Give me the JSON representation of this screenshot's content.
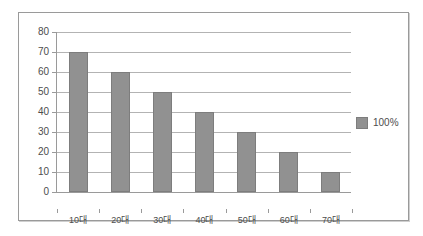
{
  "chart_data": {
    "type": "bar",
    "title": "",
    "subtitle": "",
    "xlabel": "",
    "ylabel": "",
    "categories": [
      "10대",
      "20대",
      "30대",
      "40대",
      "50대",
      "60대",
      "70대"
    ],
    "values": [
      70,
      60,
      50,
      40,
      30,
      20,
      10
    ],
    "series": [
      {
        "name": "100%",
        "values": [
          70,
          60,
          50,
          40,
          30,
          20,
          10
        ]
      }
    ],
    "ylim": [
      0,
      80
    ],
    "ytick_step": 10,
    "ytick_labels": [
      "80",
      "70",
      "60",
      "50",
      "40",
      "30",
      "20",
      "10",
      "0"
    ],
    "ytick_values": [
      80,
      70,
      60,
      50,
      40,
      30,
      20,
      10,
      0
    ],
    "grid": true,
    "grid_axis": "y",
    "legend": {
      "position": "right",
      "entries": [
        {
          "label": "100%",
          "color": "#919191"
        }
      ]
    },
    "colors": {
      "bar_fill": "#919191",
      "bar_stroke": "#7d7d7d",
      "gridline": "#b3b3b3",
      "axis": "#9a9a9a",
      "text": "#4d4d4d",
      "frame": "#9a9a9a",
      "background": "#ffffff"
    }
  }
}
